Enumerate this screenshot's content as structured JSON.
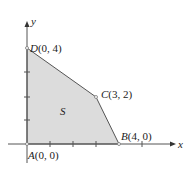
{
  "diagram": {
    "axes": {
      "x_label": "x",
      "y_label": "y"
    },
    "region_label": "S",
    "fill_color": "#dcdcdc",
    "points": [
      {
        "name": "A",
        "coord": "(0, 0)",
        "x": 0,
        "y": 0
      },
      {
        "name": "B",
        "coord": "(4, 0)",
        "x": 4,
        "y": 0
      },
      {
        "name": "C",
        "coord": "(3, 2)",
        "x": 3,
        "y": 2
      },
      {
        "name": "D",
        "coord": "(0, 4)",
        "x": 0,
        "y": 4
      }
    ]
  }
}
